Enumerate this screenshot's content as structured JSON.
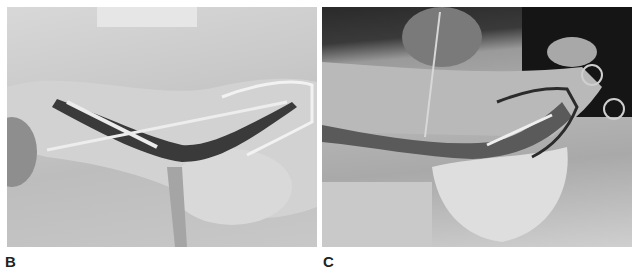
{
  "figure": {
    "panels": [
      {
        "label": "B",
        "description": "Grayscale intraoperative photograph: lateral foot incision held open by retractors, with a long slender instrument passed through the wound"
      },
      {
        "label": "C",
        "description": "Grayscale intraoperative photograph: extended lateral incision with a toothed retractor above and a wire loop retractor at the forefoot, a slender instrument in the wound"
      }
    ],
    "colors": {
      "background": "#ffffff",
      "label_text": "#222222"
    }
  }
}
